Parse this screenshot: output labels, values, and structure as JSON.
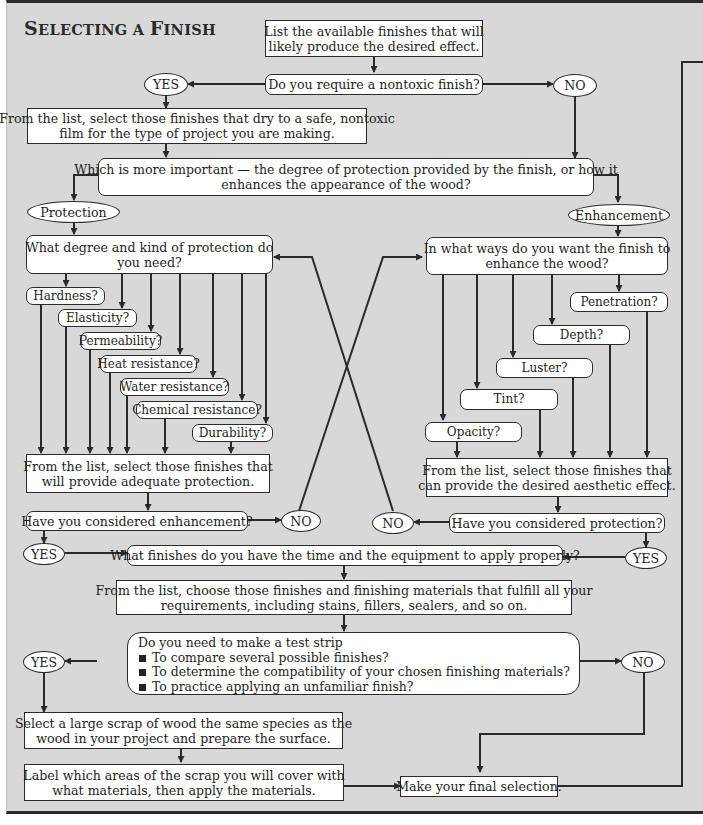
{
  "title": {
    "part1_cap": "S",
    "part1_rest": "ELECTING A ",
    "part2_cap": "F",
    "part2_rest": "INISH",
    "full": "Selecting a Finish"
  },
  "nodes": {
    "list_finishes": "List the available finishes that will likely produce the desired effect.",
    "list_finishes_l1": "List the available finishes that will",
    "list_finishes_l2": "likely produce the desired effect.",
    "nontoxic_q": "Do you require a nontoxic finish?",
    "yes1": "YES",
    "no1": "NO",
    "nontoxic_select_l1": "From the list, select those finishes that dry to a safe, nontoxic",
    "nontoxic_select_l2": "film for the type of project you are making.",
    "importance_q_l1": "Which is more important — the degree of protection provided by the finish, or how it",
    "importance_q_l2": "enhances the appearance of the wood?",
    "protection": "Protection",
    "enhancement": "Enhancement",
    "protection_q_l1": "What degree and kind of protection do",
    "protection_q_l2": "you need?",
    "enhance_q_l1": "In what ways do you want the finish to",
    "enhance_q_l2": "enhance the wood?",
    "protection_select_l1": "From the list, select those finishes that",
    "protection_select_l2": "will provide adequate protection.",
    "enhance_select_l1": "From the list, select those finishes that",
    "enhance_select_l2": "can provide the desired aesthetic effect.",
    "considered_enhancement": "Have you considered enhancement?",
    "considered_protection": "Have you considered protection?",
    "no_left": "NO",
    "no_right": "NO",
    "yes_left": "YES",
    "yes_right": "YES",
    "time_equipment_q": "What finishes do you have the time and the equipment to apply properly?",
    "choose_l1": "From the list, choose those finishes and finishing materials that fulfill all your",
    "choose_l2": "requirements, including stains, fillers, sealers, and so on.",
    "test_strip_q": "Do you need to make a test strip",
    "test_strip_items": [
      "To compare several possible finishes?",
      "To determine the compatibility of your chosen finishing materials?",
      "To practice applying an unfamiliar finish?"
    ],
    "yes_test": "YES",
    "no_test": "NO",
    "scrap_l1": "Select a large scrap of wood the same species as the",
    "scrap_l2": "wood in your project and prepare the surface.",
    "label_l1": "Label which areas of the scrap you will cover with",
    "label_l2": "what materials, then apply the materials.",
    "final": "Make your final selection."
  },
  "protection_options": [
    "Hardness?",
    "Elasticity?",
    "Permeability?",
    "Heat resistance?",
    "Water resistance?",
    "Chemical resistance?",
    "Durability?"
  ],
  "enhancement_options": [
    "Penetration?",
    "Depth?",
    "Luster?",
    "Tint?",
    "Opacity?"
  ],
  "colors": {
    "background": "#d8d8d8",
    "box_fill": "#ffffff",
    "line": "#2a2a2a"
  }
}
